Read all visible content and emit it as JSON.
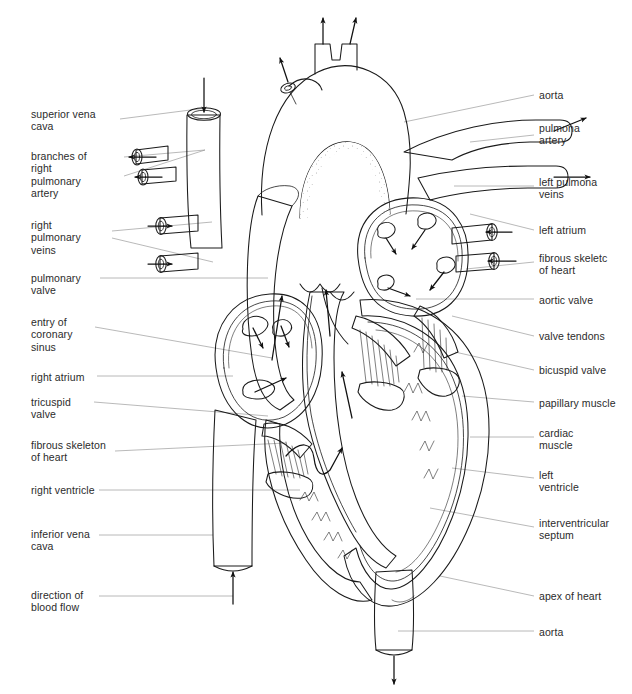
{
  "figure": {
    "background_color": "#ffffff",
    "ink_color": "#1a1a1a",
    "leader_color": "#8d8d8d"
  },
  "labels_left": [
    {
      "id": "superior-vena-cava",
      "text": "superior vena\ncava",
      "x": 31,
      "y": 108
    },
    {
      "id": "branches-right-pulmonary-artery",
      "text": "branches of\nright\npulmonary\nartery",
      "x": 31,
      "y": 150
    },
    {
      "id": "right-pulmonary-veins",
      "text": "right\npulmonary\nveins",
      "x": 31,
      "y": 219
    },
    {
      "id": "pulmonary-valve",
      "text": "pulmonary\nvalve",
      "x": 31,
      "y": 272
    },
    {
      "id": "entry-of-coronary-sinus",
      "text": "entry of\ncoronary\nsinus",
      "x": 31,
      "y": 316
    },
    {
      "id": "right-atrium",
      "text": "right atrium",
      "x": 31,
      "y": 371
    },
    {
      "id": "tricuspid-valve",
      "text": "tricuspid\nvalve",
      "x": 31,
      "y": 396
    },
    {
      "id": "fibrous-skeleton-of-heart-left",
      "text": "fibrous skeleton\nof heart",
      "x": 31,
      "y": 439
    },
    {
      "id": "right-ventricle",
      "text": "right ventricle",
      "x": 31,
      "y": 484
    },
    {
      "id": "inferior-vena-cava",
      "text": "inferior vena\ncava",
      "x": 31,
      "y": 528
    },
    {
      "id": "direction-of-blood-flow",
      "text": "direction of\nblood flow",
      "x": 31,
      "y": 589
    }
  ],
  "labels_right": [
    {
      "id": "aorta-top",
      "text": "aorta",
      "x": 539,
      "y": 89
    },
    {
      "id": "pulmonary-artery",
      "text": "pulmona\nartery",
      "x": 539,
      "y": 122
    },
    {
      "id": "left-pulmonary-veins",
      "text": "left pulmona\nveins",
      "x": 539,
      "y": 176
    },
    {
      "id": "left-atrium",
      "text": "left atrium",
      "x": 539,
      "y": 224
    },
    {
      "id": "fibrous-skeleton-of-heart-right",
      "text": "fibrous skeletc\nof heart",
      "x": 539,
      "y": 252
    },
    {
      "id": "aortic-valve",
      "text": "aortic valve",
      "x": 539,
      "y": 294
    },
    {
      "id": "valve-tendons",
      "text": "valve tendons",
      "x": 539,
      "y": 330
    },
    {
      "id": "bicuspid-valve",
      "text": "bicuspid valve",
      "x": 539,
      "y": 364
    },
    {
      "id": "papillary-muscle",
      "text": "papillary muscle",
      "x": 539,
      "y": 397
    },
    {
      "id": "cardiac-muscle",
      "text": "cardiac\nmuscle",
      "x": 539,
      "y": 427
    },
    {
      "id": "left-ventricle",
      "text": "left\nventricle",
      "x": 539,
      "y": 469
    },
    {
      "id": "interventricular-septum",
      "text": "interventricular\nseptum",
      "x": 539,
      "y": 517
    },
    {
      "id": "apex-of-heart",
      "text": "apex of heart",
      "x": 539,
      "y": 590
    },
    {
      "id": "aorta-bottom",
      "text": "aorta",
      "x": 539,
      "y": 626
    }
  ]
}
